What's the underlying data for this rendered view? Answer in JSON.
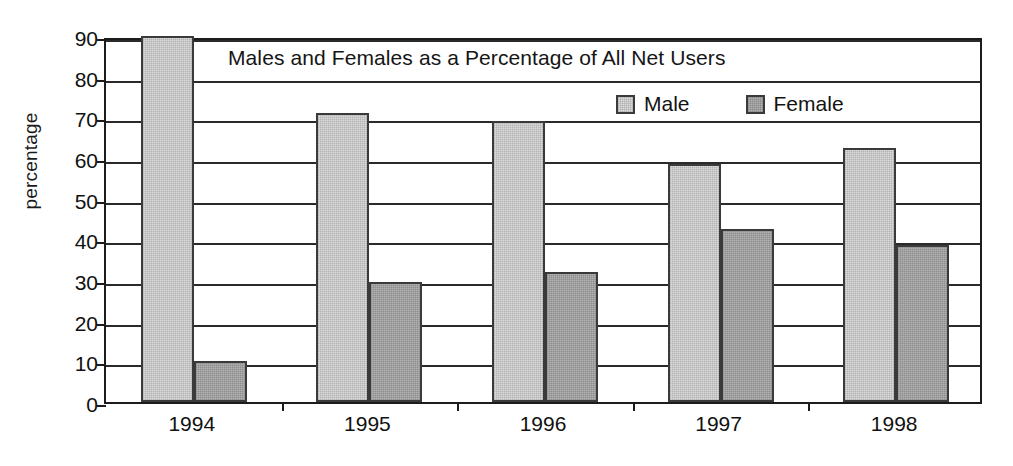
{
  "chart_data": {
    "type": "bar",
    "title": "Males and Females as a Percentage of All Net Users",
    "xlabel": "",
    "ylabel": "percentage",
    "categories": [
      "1994",
      "1995",
      "1996",
      "1997",
      "1998"
    ],
    "series": [
      {
        "name": "Male",
        "color": "#dcdcdc",
        "values": [
          90,
          71,
          69,
          58.5,
          62.5
        ]
      },
      {
        "name": "Female",
        "color": "#b2b2b2",
        "values": [
          10,
          29.5,
          32,
          42.5,
          38.5
        ]
      }
    ],
    "ylim": [
      0,
      90
    ],
    "ytick_step": 10,
    "yticks": [
      "0",
      "10",
      "20",
      "30",
      "40",
      "50",
      "60",
      "70",
      "80",
      "90"
    ],
    "grid": true,
    "legend_position": "top-right-inside",
    "note_male_1994_clipped_at_axis_max": true
  },
  "legend": {
    "items": [
      {
        "label": "Male"
      },
      {
        "label": "Female"
      }
    ]
  },
  "axes": {
    "y_title": "percentage"
  }
}
